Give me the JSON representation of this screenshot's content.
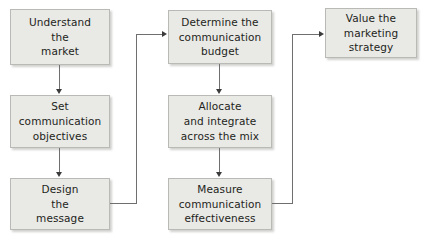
{
  "diagram": {
    "background_color": "#ffffff",
    "node_fill_color": "#e9e9e6",
    "node_border_color": "#b9b9b5",
    "text_color": "#231f20",
    "connector_color": "#6f6f6f",
    "nodes": [
      {
        "id": "understand-market",
        "label": "Understand\nthe\nmarket"
      },
      {
        "id": "set-objectives",
        "label": "Set\ncommunication\nobjectives"
      },
      {
        "id": "design-message",
        "label": "Design\nthe\nmessage"
      },
      {
        "id": "determine-budget",
        "label": "Determine the\ncommunication\nbudget"
      },
      {
        "id": "allocate-integrate",
        "label": "Allocate\nand integrate\nacross the mix"
      },
      {
        "id": "measure-effectiveness",
        "label": "Measure\ncommunication\neffectiveness"
      },
      {
        "id": "value-strategy",
        "label": "Value the\nmarketing\nstrategy"
      }
    ],
    "edges": [
      {
        "id": "edge-understand-to-objectives",
        "from": "understand-market",
        "to": "set-objectives",
        "style": "straight-down"
      },
      {
        "id": "edge-objectives-to-design",
        "from": "set-objectives",
        "to": "design-message",
        "style": "straight-down"
      },
      {
        "id": "edge-design-to-budget",
        "from": "design-message",
        "to": "determine-budget",
        "style": "elbow-right-up-right"
      },
      {
        "id": "edge-budget-to-allocate",
        "from": "determine-budget",
        "to": "allocate-integrate",
        "style": "straight-down"
      },
      {
        "id": "edge-allocate-to-measure",
        "from": "allocate-integrate",
        "to": "measure-effectiveness",
        "style": "straight-down"
      },
      {
        "id": "edge-measure-to-value",
        "from": "measure-effectiveness",
        "to": "value-strategy",
        "style": "elbow-right-up-right"
      }
    ]
  }
}
